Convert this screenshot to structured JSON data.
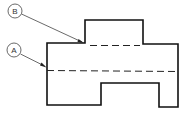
{
  "diagram": {
    "type": "technical-drawing",
    "colors": {
      "background": "#ffffff",
      "line": "#111111",
      "callout": "#444444",
      "hidden_line": "#222222"
    },
    "callouts": [
      {
        "id": "B",
        "label": "B",
        "target": "upper hidden line"
      },
      {
        "id": "A",
        "label": "A",
        "target": "center hidden line"
      }
    ],
    "lines": {
      "visible_outline": "object outline",
      "hidden_upper": "hidden line B",
      "hidden_center": "hidden line A"
    }
  }
}
